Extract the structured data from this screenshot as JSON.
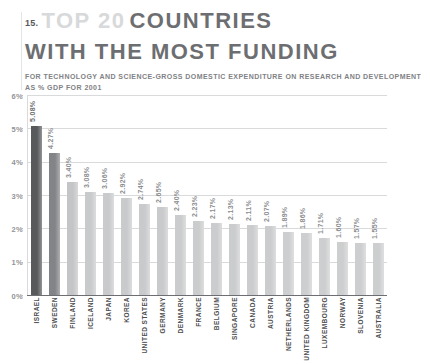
{
  "header": {
    "number": "15.",
    "title_light": "TOP 20",
    "title_bold": "COUNTRIES",
    "title_line2": "WITH THE MOST FUNDING",
    "subtitle_line1": "FOR TECHNOLOGY AND SCIENCE-GROSS DOMESTIC EXPENDITURE ON RESEARCH AND DEVELOPMENT",
    "subtitle_line2": "AS % GDP FOR 2001"
  },
  "colors": {
    "title_bold": "#6d6e71",
    "title_light": "#d8d9da",
    "subtitle": "#808285",
    "axis": "#6d6e71",
    "gridline": "#d9dadb",
    "bar_highlight": "#58595b",
    "bar_secondary": "#828487",
    "bar_default": "#c9cacc",
    "value_label": "#8b8d8f",
    "category_label": "#4d4e50"
  },
  "chart_data": {
    "type": "bar",
    "subtitle": "FOR TECHNOLOGY AND SCIENCE-GROSS DOMESTIC EXPENDITURE ON RESEARCH AND DEVELOPMENT AS % GDP FOR 2001",
    "xlabel": "",
    "ylabel": "",
    "ylim": [
      0,
      6
    ],
    "grid": true,
    "legend": "none",
    "y_ticks": [
      "0%",
      "1%",
      "2%",
      "3%",
      "4%",
      "5%",
      "6%"
    ],
    "y_tick_values": [
      0,
      1,
      2,
      3,
      4,
      5,
      6
    ],
    "categories": [
      "ISRAEL",
      "SWEDEN",
      "FINLAND",
      "ICELAND",
      "JAPAN",
      "KOREA",
      "UNITED STATES",
      "GERMANY",
      "DENMARK",
      "FRANCE",
      "BELGIUM",
      "SINGAPORE",
      "CANADA",
      "AUSTRIA",
      "NETHERLANDS",
      "UNITED KINGDOM",
      "LUXEMBOURG",
      "NORWAY",
      "SLOVENIA",
      "AUSTRALIA"
    ],
    "values": [
      5.08,
      4.27,
      3.4,
      3.08,
      3.06,
      2.92,
      2.74,
      2.65,
      2.4,
      2.23,
      2.17,
      2.13,
      2.11,
      2.07,
      1.89,
      1.86,
      1.71,
      1.6,
      1.57,
      1.55
    ],
    "data_labels": [
      "5.08%",
      "4.27%",
      "3.40%",
      "3.08%",
      "3.06%",
      "2.92%",
      "2.74%",
      "2.65%",
      "2.40%",
      "2.23%",
      "2.17%",
      "2.13%",
      "2.11%",
      "2.07%",
      "1.89%",
      "1.86%",
      "1.71%",
      "1.60%",
      "1.57%",
      "1.55%"
    ],
    "bar_colors": [
      "#58595b",
      "#828487",
      "#c4c5c7",
      "#c9cacc",
      "#c9cacc",
      "#c9cacc",
      "#c9cacc",
      "#c9cacc",
      "#cbcccd",
      "#cbcccd",
      "#cbcccd",
      "#cbcccd",
      "#cbcccd",
      "#cbcccd",
      "#cdcecf",
      "#cdcecf",
      "#cdcecf",
      "#cdcecf",
      "#cdcecf",
      "#cdcecf"
    ]
  }
}
